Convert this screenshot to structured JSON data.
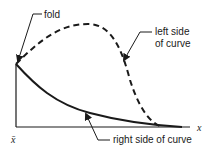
{
  "diagram": {
    "labels": {
      "fold": "fold",
      "left_side_line1": "left side",
      "left_side_line2": "of curve",
      "right_side": "right side of curve",
      "x_bar": "x̄",
      "x_axis": "x"
    },
    "colors": {
      "ink": "#1a1a1a",
      "background": "#ffffff"
    },
    "elements": [
      {
        "name": "vertical-axis",
        "style": "solid"
      },
      {
        "name": "horizontal-axis",
        "style": "solid"
      },
      {
        "name": "left-side-of-curve",
        "style": "dashed"
      },
      {
        "name": "right-side-of-curve",
        "style": "solid"
      }
    ]
  }
}
